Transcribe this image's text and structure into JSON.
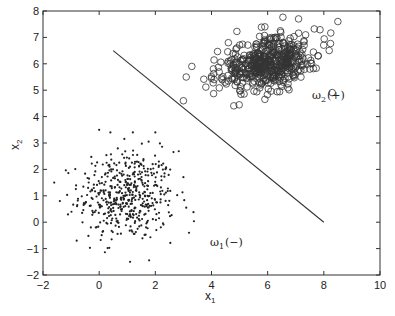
{
  "chart_data": {
    "type": "scatter",
    "title": "",
    "xlabel": "x",
    "xlabel_sub": "1",
    "ylabel": "x",
    "ylabel_sub": "2",
    "xlim": [
      -2,
      10
    ],
    "ylim": [
      -2,
      8
    ],
    "xticks": [
      -2,
      0,
      2,
      4,
      6,
      8,
      10
    ],
    "yticks": [
      -2,
      -1,
      0,
      1,
      2,
      3,
      4,
      5,
      6,
      7,
      8
    ],
    "grid": false,
    "legend": null,
    "series": [
      {
        "name": "ω1 (−)",
        "marker": "dot",
        "color": "#222222",
        "count": 500,
        "distribution": {
          "mean": [
            1.0,
            1.0
          ],
          "std": [
            0.85,
            0.85
          ],
          "corr": 0.0,
          "seed": 12345
        },
        "extra_points": [
          [
            -1.6,
            1.5
          ],
          [
            -0.8,
            -0.7
          ],
          [
            3.2,
            -0.4
          ],
          [
            3.1,
            0.55
          ],
          [
            1.1,
            -1.5
          ],
          [
            -1.4,
            0.8
          ],
          [
            0.0,
            3.5
          ],
          [
            2.0,
            3.4
          ],
          [
            1.2,
            3.4
          ],
          [
            0.4,
            3.4
          ]
        ]
      },
      {
        "name": "ω2 (+)",
        "marker": "open-circle",
        "color": "#333333",
        "count": 500,
        "distribution": {
          "mean": [
            6.0,
            6.0
          ],
          "std": [
            0.85,
            0.5
          ],
          "corr": 0.35,
          "seed": 67890
        },
        "extra_points": [
          [
            3.0,
            4.6
          ],
          [
            3.1,
            5.5
          ],
          [
            8.5,
            7.6
          ],
          [
            7.1,
            7.7
          ],
          [
            3.3,
            5.9
          ],
          [
            4.6,
            6.8
          ],
          [
            5.9,
            7.4
          ],
          [
            7.3,
            6.7
          ],
          [
            7.5,
            5.8
          ],
          [
            7.8,
            6.3
          ]
        ]
      }
    ],
    "lines": [
      {
        "name": "decision-boundary",
        "x": [
          0.5,
          8.0
        ],
        "y": [
          6.5,
          0.0
        ],
        "color": "#333333"
      }
    ],
    "annotations": [
      {
        "text": "ω",
        "sub": "2",
        "suffix": "(+)",
        "x": 7.5,
        "y": 5.2
      },
      {
        "text": "ω",
        "sub": "1",
        "suffix": "(−)",
        "x": 4.0,
        "y": -0.8
      }
    ]
  }
}
